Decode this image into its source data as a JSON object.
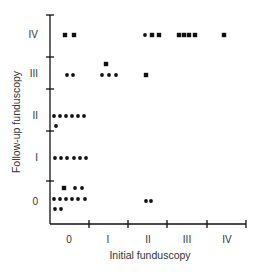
{
  "chart_data": {
    "type": "scatter",
    "title": "",
    "xlabel": "Initial funduscopy",
    "ylabel": "Follow-up funduscopy",
    "x_categories": [
      "0",
      "I",
      "II",
      "III",
      "IV"
    ],
    "y_categories": [
      "0",
      "I",
      "II",
      "III",
      "IV"
    ],
    "grid": false,
    "legend": null,
    "marker_styles": {
      "dot": "small round dot",
      "square": "small filled square"
    },
    "points": [
      {
        "x": "0",
        "y": "IV",
        "count": 2,
        "rows": [
          [
            {
              "n": 2,
              "marker": "square"
            }
          ]
        ]
      },
      {
        "x": "0",
        "y": "III",
        "count": 2,
        "rows": [
          [
            {
              "n": 2,
              "marker": "dot"
            }
          ]
        ]
      },
      {
        "x": "0",
        "y": "II",
        "count": 7,
        "rows": [
          [
            {
              "n": 6,
              "marker": "dot"
            }
          ],
          [
            {
              "n": 1,
              "marker": "dot"
            }
          ]
        ]
      },
      {
        "x": "0",
        "y": "I",
        "count": 6,
        "rows": [
          [
            {
              "n": 6,
              "marker": "dot"
            }
          ]
        ]
      },
      {
        "x": "0",
        "y": "0",
        "count": 11,
        "rows": [
          [
            {
              "n": 3,
              "marker": "square"
            }
          ],
          [
            {
              "n": 6,
              "marker": "dot"
            }
          ],
          [
            {
              "n": 2,
              "marker": "dot"
            }
          ]
        ]
      },
      {
        "x": "I",
        "y": "III",
        "count": 4,
        "rows": [
          [
            {
              "n": 1,
              "marker": "square"
            }
          ],
          [
            {
              "n": 3,
              "marker": "dot"
            }
          ]
        ]
      },
      {
        "x": "II",
        "y": "IV",
        "count": 3,
        "rows": [
          [
            {
              "n": 3,
              "marker": "square"
            }
          ]
        ]
      },
      {
        "x": "II",
        "y": "III",
        "count": 1,
        "rows": [
          [
            {
              "n": 1,
              "marker": "square"
            }
          ]
        ]
      },
      {
        "x": "II",
        "y": "0",
        "count": 2,
        "rows": [
          [
            {
              "n": 2,
              "marker": "dot"
            }
          ]
        ]
      },
      {
        "x": "III",
        "y": "IV",
        "count": 4,
        "rows": [
          [
            {
              "n": 4,
              "marker": "square"
            }
          ]
        ]
      },
      {
        "x": "IV",
        "y": "IV",
        "count": 1,
        "rows": [
          [
            {
              "n": 1,
              "marker": "square"
            }
          ]
        ]
      }
    ],
    "total_n": 43
  },
  "dot_layout": [
    {
      "cx": 65,
      "cy": 35,
      "m": "square"
    },
    {
      "cx": 74,
      "cy": 35,
      "m": "square"
    },
    {
      "cx": 67,
      "cy": 75,
      "m": "dot"
    },
    {
      "cx": 73,
      "cy": 75,
      "m": "dot"
    },
    {
      "cx": 54,
      "cy": 116,
      "m": "dot"
    },
    {
      "cx": 60,
      "cy": 116,
      "m": "dot"
    },
    {
      "cx": 66,
      "cy": 116,
      "m": "dot"
    },
    {
      "cx": 72,
      "cy": 116,
      "m": "dot"
    },
    {
      "cx": 78,
      "cy": 116,
      "m": "dot"
    },
    {
      "cx": 84,
      "cy": 116,
      "m": "dot"
    },
    {
      "cx": 56,
      "cy": 126,
      "m": "dot"
    },
    {
      "cx": 55,
      "cy": 158,
      "m": "dot"
    },
    {
      "cx": 61,
      "cy": 158,
      "m": "dot"
    },
    {
      "cx": 67,
      "cy": 158,
      "m": "dot"
    },
    {
      "cx": 74,
      "cy": 158,
      "m": "dot"
    },
    {
      "cx": 80,
      "cy": 158,
      "m": "dot"
    },
    {
      "cx": 86,
      "cy": 158,
      "m": "dot"
    },
    {
      "cx": 64,
      "cy": 188,
      "m": "square"
    },
    {
      "cx": 75,
      "cy": 188,
      "m": "dot"
    },
    {
      "cx": 82,
      "cy": 188,
      "m": "dot"
    },
    {
      "cx": 54,
      "cy": 199,
      "m": "dot"
    },
    {
      "cx": 60,
      "cy": 199,
      "m": "dot"
    },
    {
      "cx": 66,
      "cy": 199,
      "m": "dot"
    },
    {
      "cx": 72,
      "cy": 199,
      "m": "dot"
    },
    {
      "cx": 78,
      "cy": 199,
      "m": "dot"
    },
    {
      "cx": 85,
      "cy": 199,
      "m": "dot"
    },
    {
      "cx": 55,
      "cy": 209,
      "m": "dot"
    },
    {
      "cx": 61,
      "cy": 209,
      "m": "dot"
    },
    {
      "cx": 106,
      "cy": 64,
      "m": "square"
    },
    {
      "cx": 102,
      "cy": 75,
      "m": "dot"
    },
    {
      "cx": 109,
      "cy": 75,
      "m": "dot"
    },
    {
      "cx": 116,
      "cy": 75,
      "m": "dot"
    },
    {
      "cx": 145,
      "cy": 35,
      "m": "dot"
    },
    {
      "cx": 152,
      "cy": 35,
      "m": "square"
    },
    {
      "cx": 159,
      "cy": 35,
      "m": "square"
    },
    {
      "cx": 146,
      "cy": 75,
      "m": "square"
    },
    {
      "cx": 146,
      "cy": 201,
      "m": "dot"
    },
    {
      "cx": 151,
      "cy": 201,
      "m": "dot"
    },
    {
      "cx": 179,
      "cy": 35,
      "m": "square"
    },
    {
      "cx": 184,
      "cy": 35,
      "m": "square"
    },
    {
      "cx": 189,
      "cy": 35,
      "m": "square"
    },
    {
      "cx": 195,
      "cy": 35,
      "m": "square"
    },
    {
      "cx": 224,
      "cy": 35,
      "m": "square"
    }
  ],
  "axes": {
    "x_tick_labels": [
      "0",
      "I",
      "II",
      "III",
      "IV"
    ],
    "y_tick_labels": [
      "0",
      "I",
      "II",
      "III",
      "IV"
    ],
    "x_title": "Initial funduscopy",
    "y_title": "Follow-up funduscopy"
  },
  "colors": {
    "ink": "#111111",
    "text": "#333333",
    "background": "#ffffff"
  }
}
